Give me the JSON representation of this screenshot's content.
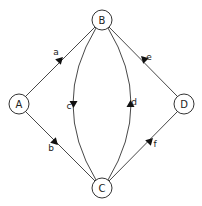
{
  "diagram": {
    "type": "directed-graph",
    "nodes": [
      {
        "id": "A",
        "label": "A",
        "x": 19,
        "y": 104
      },
      {
        "id": "B",
        "label": "B",
        "x": 102,
        "y": 20
      },
      {
        "id": "C",
        "label": "C",
        "x": 102,
        "y": 188
      },
      {
        "id": "D",
        "label": "D",
        "x": 184,
        "y": 104
      }
    ],
    "edges": [
      {
        "id": "a",
        "label": "a",
        "from": "A",
        "to": "B"
      },
      {
        "id": "b",
        "label": "b",
        "from": "A",
        "to": "C"
      },
      {
        "id": "c",
        "label": "c",
        "from": "B",
        "to": "C",
        "curve": "left"
      },
      {
        "id": "d",
        "label": "d",
        "from": "C",
        "to": "B",
        "curve": "right"
      },
      {
        "id": "e",
        "label": "e",
        "from": "D",
        "to": "B"
      },
      {
        "id": "f",
        "label": "f",
        "from": "C",
        "to": "D"
      }
    ],
    "colors": {
      "stroke": "#333333",
      "arrow": "#111111",
      "background": "#ffffff"
    }
  }
}
